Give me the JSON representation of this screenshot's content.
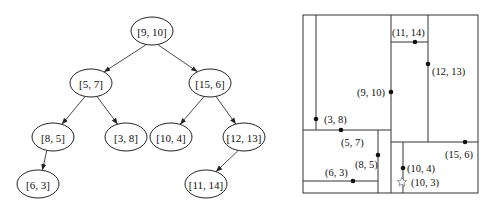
{
  "kd_tree": {
    "nodes": [
      {
        "id": "n0",
        "label": "[9, 10]",
        "cx": 152,
        "cy": 31
      },
      {
        "id": "n1",
        "label": "[5, 7]",
        "cx": 91,
        "cy": 83
      },
      {
        "id": "n2",
        "label": "[15, 6]",
        "cx": 210,
        "cy": 83
      },
      {
        "id": "n3",
        "label": "[8, 5]",
        "cx": 53,
        "cy": 137
      },
      {
        "id": "n4",
        "label": "[3, 8]",
        "cx": 126,
        "cy": 137
      },
      {
        "id": "n5",
        "label": "[10, 4]",
        "cx": 171,
        "cy": 137
      },
      {
        "id": "n6",
        "label": "[12, 13]",
        "cx": 244,
        "cy": 137
      },
      {
        "id": "n7",
        "label": "[6, 3]",
        "cx": 38,
        "cy": 184
      },
      {
        "id": "n8",
        "label": "[11, 14]",
        "cx": 206,
        "cy": 184
      }
    ],
    "edges": [
      [
        "n0",
        "n1"
      ],
      [
        "n0",
        "n2"
      ],
      [
        "n1",
        "n3"
      ],
      [
        "n1",
        "n4"
      ],
      [
        "n2",
        "n5"
      ],
      [
        "n2",
        "n6"
      ],
      [
        "n3",
        "n7"
      ],
      [
        "n6",
        "n8"
      ]
    ],
    "node_rx": 21,
    "node_ry": 14
  },
  "partition": {
    "bounds": {
      "x1": 303,
      "y1": 15,
      "x2": 478,
      "y2": 193
    },
    "splits": [
      {
        "id": "split-9-10",
        "x1": 391,
        "y1": 15,
        "x2": 391,
        "y2": 193
      },
      {
        "id": "split-5-7",
        "x1": 303,
        "y1": 130,
        "x2": 391,
        "y2": 130
      },
      {
        "id": "split-15-6",
        "x1": 391,
        "y1": 142,
        "x2": 478,
        "y2": 142
      },
      {
        "id": "split-3-8",
        "x1": 316,
        "y1": 15,
        "x2": 316,
        "y2": 130
      },
      {
        "id": "split-8-5",
        "x1": 378,
        "y1": 130,
        "x2": 378,
        "y2": 193
      },
      {
        "id": "split-12-13",
        "x1": 428,
        "y1": 15,
        "x2": 428,
        "y2": 142
      },
      {
        "id": "split-10-4",
        "x1": 403,
        "y1": 142,
        "x2": 403,
        "y2": 193
      },
      {
        "id": "split-6-3",
        "x1": 303,
        "y1": 181,
        "x2": 378,
        "y2": 181
      },
      {
        "id": "split-11-14",
        "x1": 391,
        "y1": 42,
        "x2": 428,
        "y2": 42
      }
    ],
    "points": [
      {
        "label": "(9, 10)",
        "x": 391,
        "y": 92,
        "lx": 357,
        "ly": 96
      },
      {
        "label": "(5, 7)",
        "x": 341,
        "y": 130,
        "lx": 341,
        "ly": 146
      },
      {
        "label": "(15, 6)",
        "x": 465,
        "y": 142,
        "lx": 445,
        "ly": 158
      },
      {
        "label": "(3, 8)",
        "x": 316,
        "y": 119,
        "lx": 324,
        "ly": 123
      },
      {
        "label": "(8, 5)",
        "x": 378,
        "y": 155,
        "lx": 355,
        "ly": 168
      },
      {
        "label": "(10, 4)",
        "x": 403,
        "y": 168,
        "lx": 407,
        "ly": 172
      },
      {
        "label": "(12, 13)",
        "x": 428,
        "y": 64,
        "lx": 432,
        "ly": 75
      },
      {
        "label": "(6, 3)",
        "x": 353,
        "y": 181,
        "lx": 325,
        "ly": 176
      },
      {
        "label": "(11, 14)",
        "x": 415,
        "y": 42,
        "lx": 392,
        "ly": 36
      }
    ],
    "query": {
      "label": "(10, 3)",
      "x": 402,
      "y": 182,
      "lx": 411,
      "ly": 186,
      "icon": "star-icon"
    }
  },
  "colors": {
    "line": "#333333",
    "dot": "#111111",
    "star": "#888888",
    "background": "#ffffff"
  }
}
